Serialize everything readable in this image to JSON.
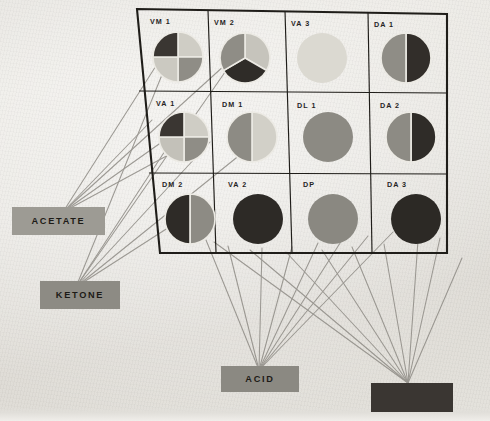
{
  "figure": {
    "background_color": "#e9e7e2",
    "frame_color": "#1f1d19",
    "connector_color": "#8e8b85"
  },
  "legend_shades": {
    "very_light": "#d9d7cf",
    "light": "#c9c7bf",
    "medium": "#8f8d86",
    "dark": "#332f2b"
  },
  "grid": {
    "rows": 3,
    "cols": 4,
    "cells": [
      {
        "id": "VM1",
        "label": "VM 1",
        "row": 0,
        "col": 0,
        "pie": {
          "type": "pie",
          "slices": [
            {
              "value": 25,
              "color": "#cfcdc5"
            },
            {
              "value": 25,
              "color": "#8f8d86"
            },
            {
              "value": 25,
              "color": "#cbc9c1"
            },
            {
              "value": 25,
              "color": "#3a3632"
            }
          ]
        }
      },
      {
        "id": "VM2",
        "label": "VM 2",
        "row": 0,
        "col": 1,
        "pie": {
          "type": "pie",
          "slices": [
            {
              "value": 33.3,
              "color": "#c6c4bc"
            },
            {
              "value": 33.3,
              "color": "#2f2c28"
            },
            {
              "value": 33.4,
              "color": "#8f8d86"
            }
          ]
        }
      },
      {
        "id": "VA3",
        "label": "VA 3",
        "row": 0,
        "col": 2,
        "pie": {
          "type": "pie",
          "slices": [
            {
              "value": 100,
              "color": "#dbd9d1"
            }
          ]
        }
      },
      {
        "id": "DA1",
        "label": "DA 1",
        "row": 0,
        "col": 3,
        "pie": {
          "type": "pie",
          "slices": [
            {
              "value": 50,
              "color": "#322e2a"
            },
            {
              "value": 50,
              "color": "#8f8d86"
            }
          ]
        }
      },
      {
        "id": "VA1",
        "label": "VA 1",
        "row": 1,
        "col": 0,
        "pie": {
          "type": "pie",
          "slices": [
            {
              "value": 25,
              "color": "#cfcdc5"
            },
            {
              "value": 25,
              "color": "#8f8d86"
            },
            {
              "value": 25,
              "color": "#c3c1b9"
            },
            {
              "value": 25,
              "color": "#3a3632"
            }
          ]
        }
      },
      {
        "id": "DM1",
        "label": "DM 1",
        "row": 1,
        "col": 1,
        "pie": {
          "type": "pie",
          "slices": [
            {
              "value": 50,
              "color": "#d2d0c8"
            },
            {
              "value": 50,
              "color": "#8d8b84"
            }
          ]
        }
      },
      {
        "id": "DL1",
        "label": "DL 1",
        "row": 1,
        "col": 2,
        "pie": {
          "type": "pie",
          "slices": [
            {
              "value": 100,
              "color": "#8c8a83"
            }
          ]
        }
      },
      {
        "id": "DA2",
        "label": "DA 2",
        "row": 1,
        "col": 3,
        "pie": {
          "type": "pie",
          "slices": [
            {
              "value": 50,
              "color": "#2f2c28"
            },
            {
              "value": 50,
              "color": "#8d8b84"
            }
          ]
        }
      },
      {
        "id": "DM2",
        "label": "DM 2",
        "row": 2,
        "col": 0,
        "pie": {
          "type": "pie",
          "slices": [
            {
              "value": 50,
              "color": "#8d8b84"
            },
            {
              "value": 50,
              "color": "#2e2b27"
            }
          ]
        }
      },
      {
        "id": "VA2",
        "label": "VA 2",
        "row": 2,
        "col": 1,
        "pie": {
          "type": "pie",
          "slices": [
            {
              "value": 100,
              "color": "#2d2a26"
            }
          ]
        }
      },
      {
        "id": "DP",
        "label": "DP",
        "row": 2,
        "col": 2,
        "pie": {
          "type": "pie",
          "slices": [
            {
              "value": 100,
              "color": "#8a8881"
            }
          ]
        }
      },
      {
        "id": "DA3",
        "label": "DA 3",
        "row": 2,
        "col": 3,
        "pie": {
          "type": "pie",
          "slices": [
            {
              "value": 100,
              "color": "#2c2925"
            }
          ]
        }
      }
    ]
  },
  "boxes": [
    {
      "id": "acetate",
      "label": "ACETATE",
      "fill": "#9d9b94",
      "text_tone": "on-light"
    },
    {
      "id": "ketone",
      "label": "KETONE",
      "fill": "#8d8b84",
      "text_tone": "on-light"
    },
    {
      "id": "acid",
      "label": "ACID",
      "fill": "#8b8982",
      "text_tone": "on-light"
    },
    {
      "id": "unlabeled",
      "label": "",
      "fill": "#3a3632",
      "text_tone": "on-dark"
    }
  ]
}
